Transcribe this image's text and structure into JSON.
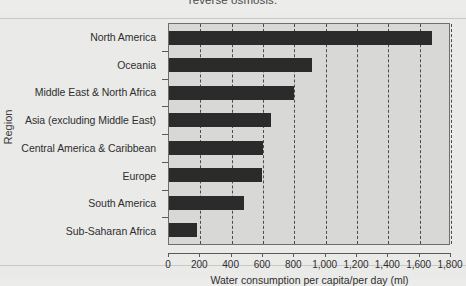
{
  "caption_fragment": "reverse osmosis.",
  "chart_data": {
    "type": "bar",
    "orientation": "horizontal",
    "title": "",
    "xlabel": "Water consumption per capita/per day (ml)",
    "ylabel": "Region",
    "categories": [
      "North America",
      "Oceania",
      "Middle East & North Africa",
      "Asia (excluding Middle East)",
      "Central America & Caribbean",
      "Europe",
      "South America",
      "Sub-Saharan Africa"
    ],
    "values": [
      1680,
      915,
      800,
      650,
      600,
      595,
      480,
      180
    ],
    "xlim": [
      0,
      1800
    ],
    "xticks": [
      0,
      200,
      400,
      600,
      800,
      1000,
      1200,
      1400,
      1600,
      1800
    ],
    "xtick_labels": [
      "0",
      "200",
      "400",
      "600",
      "800",
      "1,000",
      "1,200",
      "1,400",
      "1,600",
      "1,800"
    ],
    "grid": "vertical-dashed",
    "legend": null,
    "bar_color": "#2b2b2b",
    "plot_background": "#d8d8d7",
    "gridline_color": "#4b4b4b"
  }
}
